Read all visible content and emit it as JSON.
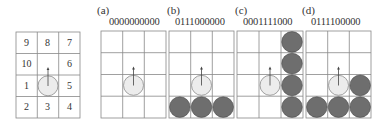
{
  "figure": {
    "legend_grid": {
      "cells": [
        [
          "9",
          "8",
          "7"
        ],
        [
          "10",
          "",
          "6"
        ],
        [
          "1",
          "",
          "5"
        ],
        [
          "2",
          "3",
          "4"
        ]
      ]
    },
    "panels": [
      {
        "label": "(a)",
        "code": "0000000000"
      },
      {
        "label": "(b)",
        "code": "0111000000"
      },
      {
        "label": "(c)",
        "code": "0001111000"
      },
      {
        "label": "(d)",
        "code": "0111100000"
      }
    ],
    "colors": {
      "grid_line": "#888888",
      "robot_fill": "#ececec",
      "robot_stroke": "#8a8a8a",
      "obstacle_fill": "#6e6e6e",
      "obstacle_stroke": "#4a4a4a",
      "arrow": "#444444"
    }
  }
}
